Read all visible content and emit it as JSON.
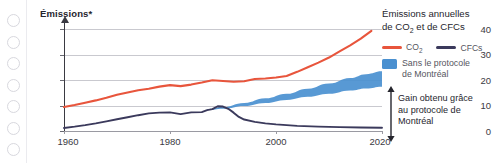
{
  "binding": {
    "hole_count": 7,
    "hole_color": "#d8d8de"
  },
  "chart_data": {
    "type": "line",
    "title": "Émissions*",
    "xlabel": "",
    "ylabel": "Émissions*",
    "xlim": [
      1960,
      2020
    ],
    "ylim": [
      0,
      40
    ],
    "xticks": [
      1960,
      1980,
      2000,
      2020
    ],
    "xtick_labels": [
      "1960",
      "1980",
      "2000",
      "2020"
    ],
    "yticks": [
      0,
      10,
      20,
      30,
      40
    ],
    "ytick_labels": [
      "0",
      "10",
      "20",
      "30",
      "40"
    ],
    "grid": true,
    "grid_axis": "y",
    "legend_position": "right",
    "legend_title": "Émissions annuelles de CO2 et de CFCs",
    "series": [
      {
        "name": "CO2",
        "label": "CO₂",
        "color": "#e8553c",
        "type": "line",
        "x": [
          1960,
          1962,
          1964,
          1966,
          1968,
          1970,
          1972,
          1974,
          1976,
          1978,
          1980,
          1982,
          1984,
          1986,
          1988,
          1990,
          1992,
          1994,
          1996,
          1998,
          2000,
          2002,
          2004,
          2006,
          2008,
          2010,
          2012,
          2014,
          2016,
          2018
        ],
        "values": [
          9.4,
          10.2,
          11.1,
          12.0,
          13.0,
          14.2,
          15.1,
          16.0,
          16.6,
          17.4,
          18.0,
          17.6,
          18.2,
          19.0,
          19.9,
          19.6,
          19.3,
          19.5,
          20.4,
          20.6,
          21.0,
          21.6,
          23.2,
          25.0,
          26.8,
          28.8,
          31.2,
          33.6,
          36.2,
          39.3
        ]
      },
      {
        "name": "CFCs",
        "label": "CFCs",
        "color": "#3b3a5c",
        "type": "line",
        "x": [
          1960,
          1962,
          1964,
          1966,
          1968,
          1970,
          1972,
          1974,
          1976,
          1978,
          1980,
          1982,
          1984,
          1986,
          1987,
          1988,
          1989,
          1990,
          1991,
          1992,
          1993,
          1994,
          1996,
          1998,
          2000,
          2004,
          2008,
          2012,
          2016,
          2020
        ],
        "values": [
          1.2,
          1.7,
          2.3,
          3.0,
          3.8,
          4.6,
          5.4,
          6.2,
          6.9,
          7.2,
          7.3,
          6.6,
          7.3,
          7.4,
          8.2,
          8.6,
          9.7,
          9.6,
          8.7,
          7.2,
          5.5,
          4.5,
          3.6,
          3.0,
          2.6,
          2.0,
          1.7,
          1.5,
          1.4,
          1.3
        ]
      },
      {
        "name": "Sans le protocole de Montréal",
        "label": "Sans le protocole de Montréal",
        "color": "#4a90d0",
        "type": "band",
        "x": [
          1987,
          1990,
          1994,
          1998,
          2002,
          2006,
          2010,
          2014,
          2017,
          2020
        ],
        "upper": [
          8.6,
          9.4,
          11.0,
          12.8,
          14.6,
          16.6,
          18.6,
          20.8,
          22.3,
          23.4
        ],
        "lower": [
          8.2,
          8.7,
          9.8,
          11.0,
          12.2,
          13.4,
          14.6,
          15.9,
          16.7,
          17.4
        ]
      }
    ],
    "annotations": [
      {
        "name": "gain-annotation",
        "text": "Gain obtenu grâce au protocole de Montréal",
        "arrow": "double-vertical",
        "x": 2020,
        "y_from": 1.3,
        "y_to": 17.4
      }
    ]
  },
  "legend": {
    "title_line1": "Émissions annuelles",
    "title_line2_a": "de CO",
    "title_line2_sub": "2",
    "title_line2_b": " et de CFCs",
    "co2_label_a": "CO",
    "co2_label_sub": "2",
    "cfc_label": "CFCs",
    "band_label_line1": "Sans le protocole",
    "band_label_line2": "de Montréal",
    "co2_color": "#e8553c",
    "cfc_color": "#3b3a5c",
    "band_color": "#4a90d0"
  },
  "annotation": {
    "line1": "Gain obtenu grâce",
    "line2": "au protocole de",
    "line3": "Montréal"
  }
}
